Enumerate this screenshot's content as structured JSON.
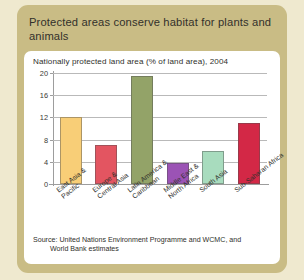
{
  "card": {
    "title": "Protected areas conserve habitat for plants and animals"
  },
  "panel": {
    "subtitle": "Nationally protected land area (% of land area), 2004",
    "source_line1": "Source: United Nations Environment Programme and WCMC, and",
    "source_line2": "World Bank estimates"
  },
  "colors": {
    "page_background": "#efe9cf",
    "card_background": "#c9bc85",
    "panel_background": "#ffffff",
    "gridline": "#b9b9b9",
    "axis": "#9d9d9d",
    "text": "#2f2f2b"
  },
  "chart_data": {
    "type": "bar",
    "title": "Nationally protected land area (% of land area), 2004",
    "xlabel": "",
    "ylabel": "",
    "ylim": [
      0,
      20
    ],
    "yticks": [
      0,
      4,
      8,
      12,
      16,
      20
    ],
    "ytick_labels": [
      "0",
      "4",
      "8",
      "12",
      "16",
      "20"
    ],
    "grid": true,
    "legend": "none",
    "categories": [
      "East Asia & Pacific",
      "Europe & Central Asia",
      "Latin America & Caribbean",
      "Middle East & North Africa",
      "South Asia",
      "Sub-Saharan Africa"
    ],
    "category_lines": [
      [
        "East Asia &",
        "Pacific"
      ],
      [
        "Europe &",
        "Central Asia"
      ],
      [
        "Latin America &",
        "Caribbean"
      ],
      [
        "Middle East &",
        "North Africa"
      ],
      [
        "South Asia",
        ""
      ],
      [
        "Sub-Saharan Africa",
        ""
      ]
    ],
    "values": [
      12.0,
      7.0,
      19.5,
      3.7,
      6.0,
      11.0
    ],
    "bar_colors": [
      "#f8ce77",
      "#e35561",
      "#93a368",
      "#9b53b5",
      "#a8dcbe",
      "#d32846"
    ]
  }
}
